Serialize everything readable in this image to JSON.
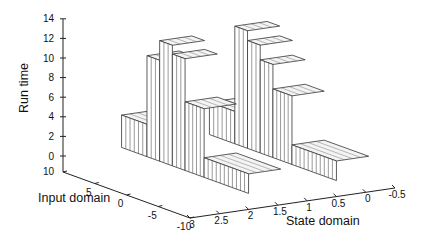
{
  "chart_data": {
    "type": "bar3d",
    "title": "",
    "zlabel": "Run time",
    "xlabel": "Input domain",
    "ylabel": "State domain",
    "z_ticks": [
      "0",
      "2",
      "4",
      "6",
      "8",
      "10",
      "12",
      "14"
    ],
    "x_ticks": [
      "10",
      "5",
      "0",
      "-5",
      "-10"
    ],
    "y_ticks": [
      "3",
      "2.5",
      "2",
      "1.5",
      "1",
      "0.5",
      "0",
      "-0.5"
    ],
    "zlim": [
      0,
      14
    ],
    "xlim": [
      10,
      -10
    ],
    "ylim": [
      3,
      -0.5
    ],
    "grid": false,
    "legend": null,
    "groups": [
      {
        "name": "state-group-near",
        "state_value": 2.0,
        "segments": [
          {
            "input_range": [
              10,
              6
            ],
            "run_time": 3.3
          },
          {
            "input_range": [
              6,
              4
            ],
            "run_time": 10.3
          },
          {
            "input_range": [
              4,
              2
            ],
            "run_time": 12.3
          },
          {
            "input_range": [
              2,
              0
            ],
            "run_time": 11.4
          },
          {
            "input_range": [
              0,
              -3
            ],
            "run_time": 7.0
          },
          {
            "input_range": [
              -3,
              -10
            ],
            "run_time": 2.0
          }
        ]
      },
      {
        "name": "state-group-far",
        "state_value": 0.5,
        "segments": [
          {
            "input_range": [
              10,
              6
            ],
            "run_time": 3.3
          },
          {
            "input_range": [
              6,
              4
            ],
            "run_time": 12.0
          },
          {
            "input_range": [
              4,
              2
            ],
            "run_time": 11.0
          },
          {
            "input_range": [
              2,
              0
            ],
            "run_time": 9.5
          },
          {
            "input_range": [
              0,
              -3
            ],
            "run_time": 7.0
          },
          {
            "input_range": [
              -3,
              -10
            ],
            "run_time": 2.0
          }
        ]
      }
    ]
  },
  "labels": {
    "z_axis": "Run time",
    "x_axis": "Input domain",
    "y_axis": "State domain"
  }
}
